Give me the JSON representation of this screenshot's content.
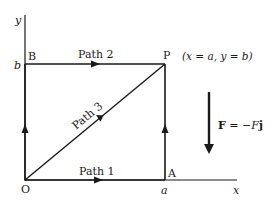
{
  "diagram": {
    "axes": {
      "x_label": "x",
      "y_label": "y"
    },
    "points": {
      "origin": "O",
      "a_corner": "A",
      "b_corner": "B",
      "p_corner": "P"
    },
    "ticks": {
      "x_tick": "a",
      "y_tick": "b"
    },
    "paths": {
      "path1": "Path 1",
      "path2": "Path 2",
      "path3": "Path 3"
    },
    "p_coordinates": "(x = a, y = b)",
    "force": {
      "bold_label": "F",
      "equals": " = −",
      "italic_label": "F",
      "unit_vector": "j"
    },
    "colors": {
      "ink": "#1a1a1a",
      "background": "#ffffff"
    }
  }
}
